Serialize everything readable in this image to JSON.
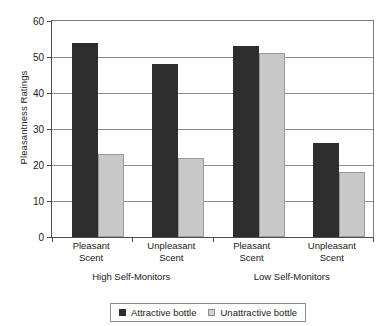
{
  "chart_data": {
    "type": "bar",
    "title": "",
    "xlabel": "",
    "ylabel": "Pleasantness Ratings",
    "ylim": [
      0,
      60
    ],
    "yticks": [
      0,
      10,
      20,
      30,
      40,
      50,
      60
    ],
    "ytick_labels": [
      "0",
      "10",
      "20",
      "30",
      "40",
      "50",
      "60"
    ],
    "grid": true,
    "legend_position": "bottom",
    "categories": [
      "Pleasant Scent",
      "Unpleasant Scent",
      "Pleasant Scent",
      "Unpleasant Scent"
    ],
    "category_lines": [
      [
        "Pleasant",
        "Scent"
      ],
      [
        "Unpleasant",
        "Scent"
      ],
      [
        "Pleasant",
        "Scent"
      ],
      [
        "Unpleasant",
        "Scent"
      ]
    ],
    "group_labels": [
      "High Self-Monitors",
      "Low Self-Monitors"
    ],
    "series": [
      {
        "name": "Attractive bottle",
        "color": "#2e2e2e",
        "values": [
          54,
          48,
          53,
          26
        ]
      },
      {
        "name": "Unattractive bottle",
        "color": "#c8c8c8",
        "values": [
          23,
          22,
          51,
          18
        ]
      }
    ]
  },
  "axis": {
    "y_title": "Pleasantness Ratings"
  },
  "x_labels": [
    {
      "line1": "Pleasant",
      "line2": "Scent"
    },
    {
      "line1": "Unpleasant",
      "line2": "Scent"
    },
    {
      "line1": "Pleasant",
      "line2": "Scent"
    },
    {
      "line1": "Unpleasant",
      "line2": "Scent"
    }
  ],
  "group_labels": [
    {
      "label": "High Self-Monitors"
    },
    {
      "label": "Low Self-Monitors"
    }
  ],
  "legend": {
    "items": [
      {
        "label": "Attractive bottle"
      },
      {
        "label": "Unattractive bottle"
      }
    ]
  },
  "y_tick_labels": [
    {
      "value": "60"
    },
    {
      "value": "50"
    },
    {
      "value": "40"
    },
    {
      "value": "30"
    },
    {
      "value": "20"
    },
    {
      "value": "10"
    },
    {
      "value": "0"
    }
  ]
}
